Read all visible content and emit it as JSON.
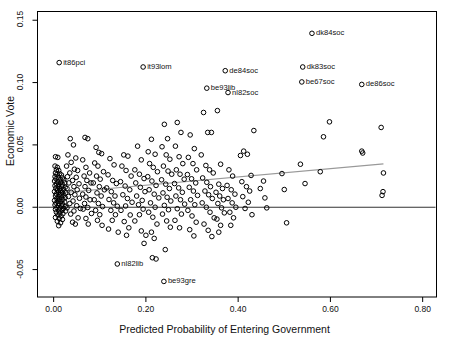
{
  "chart_data": {
    "type": "scatter",
    "title": "",
    "xlabel": "Predicted Probability of Entering Government",
    "ylabel": "Economic Vote",
    "xlim": [
      -0.035,
      0.83
    ],
    "ylim": [
      -0.072,
      0.157
    ],
    "xticks": [
      0.0,
      0.2,
      0.4,
      0.6,
      0.8
    ],
    "xticklabels": [
      "0.00",
      "0.20",
      "0.40",
      "0.60",
      "0.80"
    ],
    "yticks": [
      -0.05,
      0.0,
      0.05,
      0.1,
      0.15
    ],
    "yticklabels": [
      "-0.05",
      "0.00",
      "0.05",
      "0.10",
      "0.15"
    ],
    "grid": false,
    "legend": null,
    "marker": "open-circle",
    "reference_line": {
      "type": "horizontal",
      "y": 0.0,
      "color": "#333333"
    },
    "fit_line": {
      "type": "linear-fit",
      "color": "#999999",
      "x0": 0.0,
      "y0": 0.011,
      "x1": 0.715,
      "y1": 0.0348
    },
    "annotations": [
      {
        "label": "it86pci",
        "x": 0.012,
        "y": 0.116
      },
      {
        "label": "it93lom",
        "x": 0.194,
        "y": 0.1125
      },
      {
        "label": "dk84soc",
        "x": 0.56,
        "y": 0.1395
      },
      {
        "label": "dk83soc",
        "x": 0.54,
        "y": 0.1125
      },
      {
        "label": "de84soc",
        "x": 0.372,
        "y": 0.1095
      },
      {
        "label": "be67soc",
        "x": 0.538,
        "y": 0.1005
      },
      {
        "label": "de86soc",
        "x": 0.668,
        "y": 0.0985
      },
      {
        "label": "be93lib",
        "x": 0.332,
        "y": 0.0955
      },
      {
        "label": "nl82soc",
        "x": 0.378,
        "y": 0.092
      },
      {
        "label": "nl82lib",
        "x": 0.138,
        "y": -0.0455
      },
      {
        "label": "be93gre",
        "x": 0.239,
        "y": -0.0595
      }
    ],
    "points": [
      [
        0.004,
        0.0685
      ],
      [
        0.004,
        0.0405
      ],
      [
        0.009,
        0.04
      ],
      [
        0.003,
        0.033
      ],
      [
        0.008,
        0.032
      ],
      [
        0.006,
        0.03
      ],
      [
        0.011,
        0.0295
      ],
      [
        0.004,
        0.0275
      ],
      [
        0.013,
        0.027
      ],
      [
        0.007,
        0.0262
      ],
      [
        0.017,
        0.0258
      ],
      [
        0.003,
        0.0245
      ],
      [
        0.01,
        0.024
      ],
      [
        0.019,
        0.0235
      ],
      [
        0.005,
        0.0228
      ],
      [
        0.014,
        0.0222
      ],
      [
        0.022,
        0.0218
      ],
      [
        0.002,
        0.021
      ],
      [
        0.009,
        0.0205
      ],
      [
        0.016,
        0.02
      ],
      [
        0.024,
        0.0196
      ],
      [
        0.006,
        0.0188
      ],
      [
        0.012,
        0.0184
      ],
      [
        0.019,
        0.018
      ],
      [
        0.003,
        0.0172
      ],
      [
        0.01,
        0.0168
      ],
      [
        0.017,
        0.0164
      ],
      [
        0.025,
        0.016
      ],
      [
        0.005,
        0.0152
      ],
      [
        0.013,
        0.0148
      ],
      [
        0.021,
        0.0144
      ],
      [
        0.008,
        0.0136
      ],
      [
        0.015,
        0.0132
      ],
      [
        0.002,
        0.0126
      ],
      [
        0.011,
        0.0122
      ],
      [
        0.019,
        0.0118
      ],
      [
        0.026,
        0.0114
      ],
      [
        0.006,
        0.0106
      ],
      [
        0.014,
        0.0102
      ],
      [
        0.022,
        0.0098
      ],
      [
        0.004,
        0.009
      ],
      [
        0.01,
        0.0086
      ],
      [
        0.017,
        0.0082
      ],
      [
        0.025,
        0.0078
      ],
      [
        0.007,
        0.007
      ],
      [
        0.013,
        0.0066
      ],
      [
        0.02,
        0.0062
      ],
      [
        0.002,
        0.0054
      ],
      [
        0.009,
        0.005
      ],
      [
        0.016,
        0.0046
      ],
      [
        0.024,
        0.0042
      ],
      [
        0.005,
        0.0034
      ],
      [
        0.012,
        0.003
      ],
      [
        0.019,
        0.0026
      ],
      [
        0.003,
        0.0018
      ],
      [
        0.01,
        0.0014
      ],
      [
        0.017,
        0.001
      ],
      [
        0.025,
        0.0006
      ],
      [
        0.007,
        -0.0002
      ],
      [
        0.014,
        -0.0006
      ],
      [
        0.021,
        -0.001
      ],
      [
        0.004,
        -0.0018
      ],
      [
        0.011,
        -0.0022
      ],
      [
        0.018,
        -0.0026
      ],
      [
        0.026,
        -0.003
      ],
      [
        0.006,
        -0.004
      ],
      [
        0.013,
        -0.0046
      ],
      [
        0.02,
        -0.0052
      ],
      [
        0.009,
        -0.0062
      ],
      [
        0.016,
        -0.007
      ],
      [
        0.004,
        -0.0082
      ],
      [
        0.012,
        -0.009
      ],
      [
        0.019,
        -0.0098
      ],
      [
        0.008,
        -0.0112
      ],
      [
        0.015,
        -0.0125
      ],
      [
        0.011,
        -0.0148
      ],
      [
        0.036,
        0.055
      ],
      [
        0.043,
        0.05
      ],
      [
        0.031,
        0.042
      ],
      [
        0.048,
        0.0395
      ],
      [
        0.038,
        0.036
      ],
      [
        0.028,
        0.033
      ],
      [
        0.045,
        0.0305
      ],
      [
        0.052,
        0.0295
      ],
      [
        0.035,
        0.0275
      ],
      [
        0.03,
        0.0245
      ],
      [
        0.049,
        0.024
      ],
      [
        0.041,
        0.0215
      ],
      [
        0.033,
        0.0195
      ],
      [
        0.055,
        0.0188
      ],
      [
        0.044,
        0.0165
      ],
      [
        0.029,
        0.015
      ],
      [
        0.051,
        0.014
      ],
      [
        0.038,
        0.012
      ],
      [
        0.046,
        0.01
      ],
      [
        0.032,
        0.0086
      ],
      [
        0.056,
        0.0072
      ],
      [
        0.042,
        0.005
      ],
      [
        0.035,
        0.003
      ],
      [
        0.05,
        0.0012
      ],
      [
        0.029,
        -0.0005
      ],
      [
        0.058,
        -0.001
      ],
      [
        0.044,
        -0.003
      ],
      [
        0.037,
        -0.0055
      ],
      [
        0.053,
        -0.0085
      ],
      [
        0.041,
        -0.012
      ],
      [
        0.047,
        -0.0135
      ],
      [
        0.068,
        0.056
      ],
      [
        0.074,
        0.055
      ],
      [
        0.063,
        0.038
      ],
      [
        0.07,
        0.032
      ],
      [
        0.078,
        0.0275
      ],
      [
        0.066,
        0.025
      ],
      [
        0.072,
        0.0215
      ],
      [
        0.081,
        0.0195
      ],
      [
        0.068,
        0.0165
      ],
      [
        0.076,
        0.0135
      ],
      [
        0.063,
        0.0105
      ],
      [
        0.07,
        0.0082
      ],
      [
        0.079,
        0.006
      ],
      [
        0.067,
        0.003
      ],
      [
        0.074,
        -0.0002
      ],
      [
        0.064,
        -0.0015
      ],
      [
        0.082,
        -0.005
      ],
      [
        0.07,
        -0.009
      ],
      [
        0.075,
        -0.0135
      ],
      [
        0.092,
        0.048
      ],
      [
        0.098,
        0.044
      ],
      [
        0.104,
        0.043
      ],
      [
        0.089,
        0.0355
      ],
      [
        0.096,
        0.033
      ],
      [
        0.108,
        0.0285
      ],
      [
        0.093,
        0.025
      ],
      [
        0.101,
        0.0225
      ],
      [
        0.086,
        0.0195
      ],
      [
        0.099,
        0.0165
      ],
      [
        0.11,
        0.014
      ],
      [
        0.094,
        0.0115
      ],
      [
        0.103,
        0.009
      ],
      [
        0.088,
        0.006
      ],
      [
        0.097,
        0.003
      ],
      [
        0.106,
        0.0005
      ],
      [
        0.091,
        -0.0025
      ],
      [
        0.1,
        -0.006
      ],
      [
        0.095,
        -0.0105
      ],
      [
        0.105,
        -0.0145
      ],
      [
        0.122,
        0.039
      ],
      [
        0.131,
        0.034
      ],
      [
        0.118,
        0.026
      ],
      [
        0.128,
        0.0215
      ],
      [
        0.136,
        0.019
      ],
      [
        0.115,
        0.0155
      ],
      [
        0.125,
        0.0125
      ],
      [
        0.133,
        0.009
      ],
      [
        0.12,
        0.0062
      ],
      [
        0.13,
        0.0035
      ],
      [
        0.138,
        0.0008
      ],
      [
        0.124,
        -0.0025
      ],
      [
        0.134,
        -0.006
      ],
      [
        0.127,
        -0.0105
      ],
      [
        0.119,
        -0.0175
      ],
      [
        0.14,
        -0.02
      ],
      [
        0.152,
        0.042
      ],
      [
        0.161,
        0.041
      ],
      [
        0.148,
        0.033
      ],
      [
        0.157,
        0.0295
      ],
      [
        0.168,
        0.025
      ],
      [
        0.145,
        0.0205
      ],
      [
        0.155,
        0.017
      ],
      [
        0.165,
        0.014
      ],
      [
        0.15,
        0.01
      ],
      [
        0.16,
        0.007
      ],
      [
        0.17,
        0.004
      ],
      [
        0.156,
        0.001
      ],
      [
        0.146,
        -0.0025
      ],
      [
        0.166,
        -0.0062
      ],
      [
        0.153,
        -0.0115
      ],
      [
        0.163,
        -0.0165
      ],
      [
        0.158,
        -0.0225
      ],
      [
        0.182,
        0.049
      ],
      [
        0.19,
        0.038
      ],
      [
        0.176,
        0.03
      ],
      [
        0.186,
        0.0265
      ],
      [
        0.196,
        0.023
      ],
      [
        0.178,
        0.0195
      ],
      [
        0.188,
        0.016
      ],
      [
        0.198,
        0.0125
      ],
      [
        0.18,
        0.009
      ],
      [
        0.192,
        0.0055
      ],
      [
        0.184,
        0.002
      ],
      [
        0.194,
        -0.0015
      ],
      [
        0.186,
        -0.006
      ],
      [
        0.176,
        -0.011
      ],
      [
        0.19,
        -0.019
      ],
      [
        0.2,
        -0.0225
      ],
      [
        0.196,
        -0.029
      ],
      [
        0.212,
        0.0545
      ],
      [
        0.205,
        0.0445
      ],
      [
        0.22,
        0.0425
      ],
      [
        0.208,
        0.035
      ],
      [
        0.216,
        0.032
      ],
      [
        0.225,
        0.0285
      ],
      [
        0.204,
        0.0245
      ],
      [
        0.213,
        0.021
      ],
      [
        0.222,
        0.0175
      ],
      [
        0.207,
        0.014
      ],
      [
        0.218,
        0.0105
      ],
      [
        0.228,
        0.0075
      ],
      [
        0.21,
        0.0035
      ],
      [
        0.22,
        0.0
      ],
      [
        0.206,
        -0.004
      ],
      [
        0.215,
        -0.008
      ],
      [
        0.224,
        -0.0135
      ],
      [
        0.212,
        -0.02
      ],
      [
        0.218,
        -0.025
      ],
      [
        0.214,
        -0.0405
      ],
      [
        0.222,
        -0.0415
      ],
      [
        0.24,
        0.0665
      ],
      [
        0.247,
        0.055
      ],
      [
        0.235,
        0.0485
      ],
      [
        0.244,
        0.042
      ],
      [
        0.252,
        0.0385
      ],
      [
        0.238,
        0.033
      ],
      [
        0.248,
        0.029
      ],
      [
        0.256,
        0.0265
      ],
      [
        0.234,
        0.022
      ],
      [
        0.243,
        0.0185
      ],
      [
        0.251,
        0.015
      ],
      [
        0.237,
        0.0115
      ],
      [
        0.246,
        0.008
      ],
      [
        0.254,
        0.005
      ],
      [
        0.24,
        0.0015
      ],
      [
        0.249,
        -0.002
      ],
      [
        0.236,
        -0.0055
      ],
      [
        0.245,
        -0.011
      ],
      [
        0.253,
        -0.016
      ],
      [
        0.242,
        -0.034
      ],
      [
        0.268,
        0.068
      ],
      [
        0.276,
        0.06
      ],
      [
        0.264,
        0.049
      ],
      [
        0.272,
        0.0405
      ],
      [
        0.28,
        0.035
      ],
      [
        0.266,
        0.03
      ],
      [
        0.274,
        0.0265
      ],
      [
        0.283,
        0.0225
      ],
      [
        0.262,
        0.019
      ],
      [
        0.271,
        0.0155
      ],
      [
        0.279,
        0.012
      ],
      [
        0.265,
        0.009
      ],
      [
        0.275,
        0.006
      ],
      [
        0.284,
        0.0025
      ],
      [
        0.268,
        -0.0012
      ],
      [
        0.277,
        -0.0055
      ],
      [
        0.263,
        -0.0105
      ],
      [
        0.273,
        -0.0165
      ],
      [
        0.296,
        0.058
      ],
      [
        0.305,
        0.047
      ],
      [
        0.292,
        0.04
      ],
      [
        0.302,
        0.035
      ],
      [
        0.31,
        0.03
      ],
      [
        0.29,
        0.0262
      ],
      [
        0.299,
        0.0228
      ],
      [
        0.308,
        0.0195
      ],
      [
        0.294,
        0.016
      ],
      [
        0.303,
        0.013
      ],
      [
        0.312,
        0.0095
      ],
      [
        0.297,
        0.006
      ],
      [
        0.306,
        0.002
      ],
      [
        0.291,
        -0.0025
      ],
      [
        0.3,
        -0.007
      ],
      [
        0.309,
        -0.012
      ],
      [
        0.295,
        -0.018
      ],
      [
        0.304,
        -0.023
      ],
      [
        0.325,
        0.076
      ],
      [
        0.334,
        0.06
      ],
      [
        0.342,
        0.06
      ],
      [
        0.32,
        0.042
      ],
      [
        0.33,
        0.0335
      ],
      [
        0.338,
        0.03
      ],
      [
        0.346,
        0.0275
      ],
      [
        0.323,
        0.0235
      ],
      [
        0.332,
        0.02
      ],
      [
        0.34,
        0.0165
      ],
      [
        0.328,
        0.013
      ],
      [
        0.336,
        0.01
      ],
      [
        0.344,
        0.007
      ],
      [
        0.322,
        0.0035
      ],
      [
        0.331,
        0.0
      ],
      [
        0.339,
        -0.004
      ],
      [
        0.348,
        -0.0085
      ],
      [
        0.326,
        -0.0135
      ],
      [
        0.335,
        -0.0185
      ],
      [
        0.343,
        -0.0235
      ],
      [
        0.355,
        0.0775
      ],
      [
        0.362,
        0.0345
      ],
      [
        0.358,
        0.0185
      ],
      [
        0.366,
        0.015
      ],
      [
        0.352,
        0.012
      ],
      [
        0.36,
        0.009
      ],
      [
        0.368,
        0.006
      ],
      [
        0.356,
        0.003
      ],
      [
        0.364,
        -0.0005
      ],
      [
        0.37,
        -0.0045
      ],
      [
        0.354,
        -0.0095
      ],
      [
        0.362,
        -0.0145
      ],
      [
        0.358,
        -0.02
      ],
      [
        0.38,
        0.03
      ],
      [
        0.388,
        0.025
      ],
      [
        0.376,
        0.0175
      ],
      [
        0.385,
        0.014
      ],
      [
        0.393,
        0.0105
      ],
      [
        0.378,
        0.007
      ],
      [
        0.387,
        0.0035
      ],
      [
        0.395,
        0.0
      ],
      [
        0.382,
        -0.004
      ],
      [
        0.39,
        -0.0085
      ],
      [
        0.384,
        -0.0145
      ],
      [
        0.412,
        0.045
      ],
      [
        0.42,
        0.0425
      ],
      [
        0.405,
        0.0415
      ],
      [
        0.428,
        0.0255
      ],
      [
        0.408,
        0.0205
      ],
      [
        0.418,
        0.0165
      ],
      [
        0.425,
        0.013
      ],
      [
        0.41,
        0.0085
      ],
      [
        0.422,
        0.004
      ],
      [
        0.415,
        -0.001
      ],
      [
        0.43,
        -0.006
      ],
      [
        0.434,
        0.0615
      ],
      [
        0.455,
        0.021
      ],
      [
        0.448,
        0.015
      ],
      [
        0.462,
        -0.0005
      ],
      [
        0.458,
        0.0075
      ],
      [
        0.495,
        0.027
      ],
      [
        0.5,
        0.0142
      ],
      [
        0.505,
        -0.0125
      ],
      [
        0.535,
        0.0345
      ],
      [
        0.545,
        0.019
      ],
      [
        0.585,
        0.0565
      ],
      [
        0.598,
        0.0685
      ],
      [
        0.578,
        0.0285
      ],
      [
        0.668,
        0.045
      ],
      [
        0.67,
        0.0435
      ],
      [
        0.71,
        0.064
      ],
      [
        0.715,
        0.0275
      ],
      [
        0.714,
        0.0125
      ],
      [
        0.712,
        0.0095
      ]
    ]
  }
}
